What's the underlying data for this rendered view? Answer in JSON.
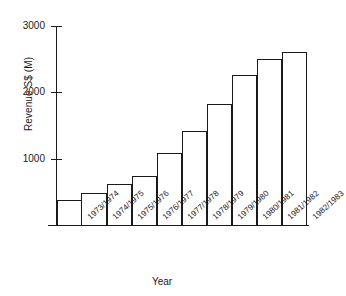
{
  "chart_data": {
    "type": "bar",
    "title": "",
    "xlabel": "Year",
    "ylabel": "Revenue S$ (M)",
    "categories": [
      "1973/1974",
      "1974/1975",
      "1975/1976",
      "1976/1977",
      "1977/1978",
      "1978/1979",
      "1979/1980",
      "1980/1981",
      "1981/1982",
      "1982/1983"
    ],
    "values": [
      370,
      480,
      620,
      745,
      1090,
      1410,
      1820,
      2255,
      2500,
      2605
    ],
    "ylim": [
      0,
      3000
    ],
    "yticks": [
      1000,
      2000,
      3000
    ],
    "ytick_labels": [
      "1000",
      "2000",
      "3000"
    ],
    "grid": false,
    "legend": false,
    "bar_style": {
      "fill": "#ffffff",
      "edge": "#1a1a1a",
      "edge_width_px": 1.3,
      "gap": 0
    },
    "axis_color": "#1a1a1a",
    "background": "#ffffff"
  }
}
